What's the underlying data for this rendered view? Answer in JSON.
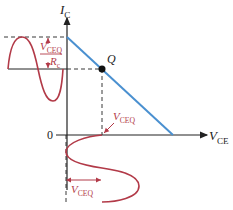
{
  "diagram": {
    "axes": {
      "y_label_main": "I",
      "y_label_sub": "C",
      "x_label_main": "V",
      "x_label_sub": "CE",
      "origin_label": "0"
    },
    "q_point_label": "Q",
    "annotations": {
      "ic_swing_num_main": "V",
      "ic_swing_num_sub": "CEQ",
      "ic_swing_den_main": "R",
      "ic_swing_den_sub": "c",
      "vce_arrow_main": "V",
      "vce_arrow_sub": "CEQ",
      "vce_swing_main": "V",
      "vce_swing_sub": "CEQ"
    },
    "colors": {
      "load_line": "#4a90d0",
      "signal": "#b23a48",
      "axis": "#222222",
      "dashed": "#222222"
    }
  }
}
